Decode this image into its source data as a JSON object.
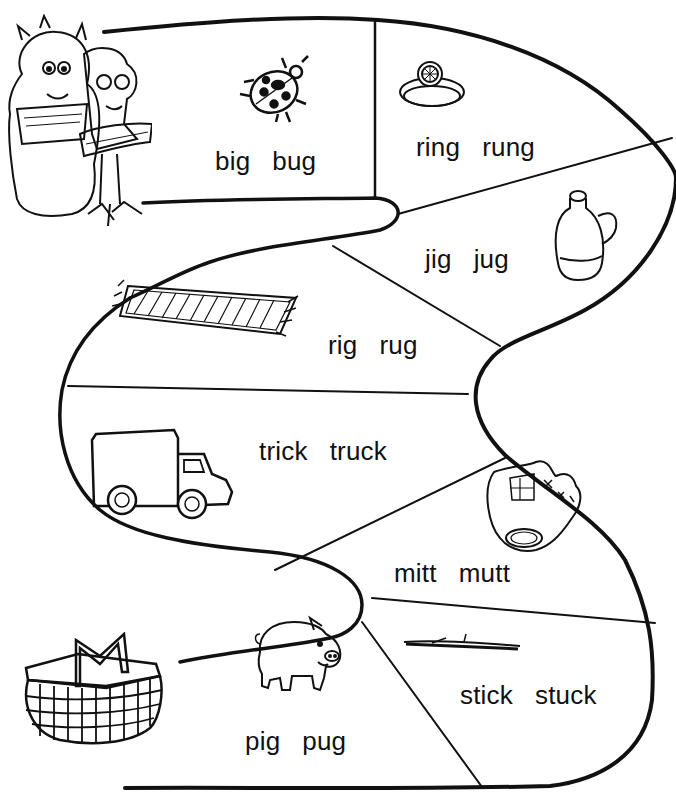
{
  "worksheet": {
    "type": "short vowel word path (i / u)",
    "colors": {
      "ink": "#111111",
      "background": "#ffffff"
    },
    "start_illustration": "monster-and-child-with-watermelon-and-sandwich",
    "end_illustration": "picnic-basket",
    "segments": [
      {
        "id": 1,
        "picture": "ladybug-icon",
        "words": [
          "big",
          "bug"
        ]
      },
      {
        "id": 2,
        "picture": "ring-icon",
        "words": [
          "ring",
          "rung"
        ]
      },
      {
        "id": 3,
        "picture": "jug-icon",
        "words": [
          "jig",
          "jug"
        ]
      },
      {
        "id": 4,
        "picture": "rug-icon",
        "words": [
          "rig",
          "rug"
        ]
      },
      {
        "id": 5,
        "picture": "truck-icon",
        "words": [
          "trick",
          "truck"
        ]
      },
      {
        "id": 6,
        "picture": "baseball-mitt-icon",
        "words": [
          "mitt",
          "mutt"
        ]
      },
      {
        "id": 7,
        "picture": "stick-icon",
        "words": [
          "stick",
          "stuck"
        ]
      },
      {
        "id": 8,
        "picture": "pig-icon",
        "words": [
          "pig",
          "pug"
        ]
      }
    ]
  }
}
